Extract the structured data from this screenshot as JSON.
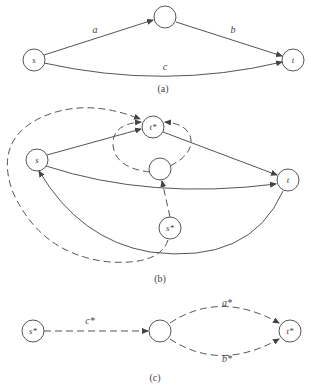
{
  "panels": {
    "a": {
      "caption": "(a)",
      "nodes": {
        "s": "s",
        "mid": "",
        "t": "t"
      },
      "edges": {
        "a": "a",
        "b": "b",
        "c": "c"
      }
    },
    "b": {
      "caption": "(b)",
      "nodes": {
        "s": "s",
        "tstar": "t*",
        "mid": "",
        "t": "t",
        "sstar": "s*"
      }
    },
    "c": {
      "caption": "(c)",
      "nodes": {
        "sstar": "s*",
        "mid": "",
        "tstar": "t*"
      },
      "edges": {
        "cstar": "c*",
        "astar": "a*",
        "bstar": "b*"
      }
    }
  },
  "colors": {
    "stroke": "#555555",
    "text": "#444444",
    "background": "#ffffff"
  }
}
